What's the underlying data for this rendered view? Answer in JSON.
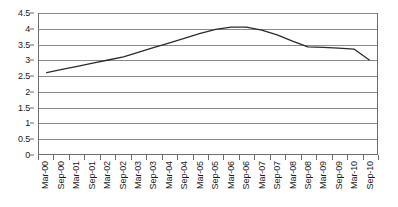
{
  "chart_data": {
    "type": "line",
    "title": "",
    "subtitle": "",
    "xlabel": "",
    "ylabel": "",
    "ylim": [
      0,
      4.5
    ],
    "grid": true,
    "legend": false,
    "legend_position": "none",
    "line_color": "#2b2b2b",
    "grid_color": "#8a8a8a",
    "axis_color": "#6d6d6d",
    "text_color": "#1a1a1a",
    "yticks": [
      "0",
      "0.5",
      "1",
      "1.5",
      "2",
      "2.5",
      "3",
      "3.5",
      "4",
      "4.5"
    ],
    "ytick_values": [
      0,
      0.5,
      1,
      1.5,
      2,
      2.5,
      3,
      3.5,
      4,
      4.5
    ],
    "categories": [
      "Mar-00",
      "Sep-00",
      "Mar-01",
      "Sep-01",
      "Mar-02",
      "Sep-02",
      "Mar-03",
      "Sep-03",
      "Mar-04",
      "Sep-04",
      "Mar-05",
      "Sep-05",
      "Mar-06",
      "Sep-06",
      "Mar-07",
      "Sep-07",
      "Mar-08",
      "Sep-08",
      "Mar-09",
      "Sep-09",
      "Mar-10",
      "Sep-10"
    ],
    "values": [
      2.6,
      2.7,
      2.8,
      2.9,
      3.0,
      3.1,
      3.25,
      3.4,
      3.55,
      3.7,
      3.85,
      3.98,
      4.05,
      4.05,
      3.95,
      3.8,
      3.6,
      3.42,
      3.4,
      3.38,
      3.35,
      3.0
    ],
    "series": [
      {
        "name": "series-1",
        "values": [
          2.6,
          2.7,
          2.8,
          2.9,
          3.0,
          3.1,
          3.25,
          3.4,
          3.55,
          3.7,
          3.85,
          3.98,
          4.05,
          4.05,
          3.95,
          3.8,
          3.6,
          3.42,
          3.4,
          3.38,
          3.35,
          3.0
        ]
      }
    ]
  }
}
